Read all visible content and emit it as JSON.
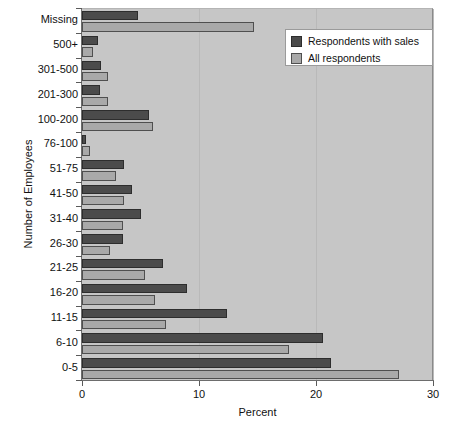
{
  "chart_data": {
    "type": "bar",
    "orientation": "horizontal",
    "title": "",
    "xlabel": "Percent",
    "ylabel": "Number of Employees",
    "xlim": [
      0,
      30
    ],
    "xticks": [
      0,
      10,
      20,
      30
    ],
    "xticklabels": [
      "0",
      "10",
      "20",
      "30"
    ],
    "grid": true,
    "legend_position": "top-right",
    "categories": [
      "Missing",
      "500+",
      "301-500",
      "201-300",
      "100-200",
      "76-100",
      "51-75",
      "41-50",
      "31-40",
      "26-30",
      "21-25",
      "16-20",
      "11-15",
      "6-10",
      "0-5"
    ],
    "series": [
      {
        "name": "Respondents with sales",
        "color": "#4b4b4b",
        "values": [
          4.8,
          1.4,
          1.6,
          1.5,
          5.7,
          0.3,
          3.6,
          4.3,
          5.0,
          3.5,
          6.9,
          9.0,
          12.4,
          20.6,
          21.3
        ]
      },
      {
        "name": "All respondents",
        "color": "#a9a9a9",
        "values": [
          14.7,
          0.9,
          2.2,
          2.2,
          6.1,
          0.7,
          2.9,
          3.6,
          3.5,
          2.4,
          5.4,
          6.2,
          7.2,
          17.7,
          27.1
        ]
      }
    ]
  },
  "legend": {
    "items": [
      {
        "label": "Respondents with sales",
        "swatch": "dark"
      },
      {
        "label": "All respondents",
        "swatch": "light"
      }
    ]
  },
  "colors": {
    "series_dark": "#4b4b4b",
    "series_light": "#a9a9a9",
    "plot_background": "#c6c6c6",
    "page_background": "#ffffff",
    "axis": "#5a5a5a"
  }
}
